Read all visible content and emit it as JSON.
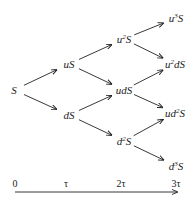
{
  "diagram": {
    "type": "binomial-tree",
    "nodes": [
      {
        "id": "S",
        "base": "",
        "pre": "",
        "sup": "",
        "post": "S",
        "label": "S",
        "x": 14,
        "y": 90
      },
      {
        "id": "uS",
        "pre": "u",
        "sup": "",
        "post": "S",
        "label": "uS",
        "x": 69,
        "y": 64
      },
      {
        "id": "dS",
        "pre": "d",
        "sup": "",
        "post": "S",
        "label": "dS",
        "x": 69,
        "y": 115
      },
      {
        "id": "u2S",
        "pre": "u",
        "sup": "2",
        "post": "S",
        "label": "u²S",
        "x": 124,
        "y": 39
      },
      {
        "id": "udS",
        "pre": "ud",
        "sup": "",
        "post": "S",
        "label": "udS",
        "x": 124,
        "y": 90
      },
      {
        "id": "d2S",
        "pre": "d",
        "sup": "2",
        "post": "S",
        "label": "d²S",
        "x": 124,
        "y": 141
      },
      {
        "id": "u3S",
        "pre": "u",
        "sup": "3",
        "post": "S",
        "label": "u³S",
        "x": 176,
        "y": 18
      },
      {
        "id": "u2dS",
        "pre": "u",
        "sup": "2",
        "post": "dS",
        "label": "u²dS",
        "x": 175,
        "y": 64
      },
      {
        "id": "ud2S",
        "pre": "ud",
        "sup": "2",
        "post": "S",
        "label": "ud²S",
        "x": 175,
        "y": 113
      },
      {
        "id": "d3S",
        "pre": "d",
        "sup": "3",
        "post": "S",
        "label": "d³S",
        "x": 176,
        "y": 166
      }
    ],
    "edges": [
      {
        "from": "S",
        "to": "uS"
      },
      {
        "from": "S",
        "to": "dS"
      },
      {
        "from": "uS",
        "to": "u2S"
      },
      {
        "from": "uS",
        "to": "udS"
      },
      {
        "from": "dS",
        "to": "udS"
      },
      {
        "from": "dS",
        "to": "d2S"
      },
      {
        "from": "u2S",
        "to": "u3S"
      },
      {
        "from": "u2S",
        "to": "u2dS"
      },
      {
        "from": "udS",
        "to": "u2dS"
      },
      {
        "from": "udS",
        "to": "ud2S"
      },
      {
        "from": "d2S",
        "to": "ud2S"
      },
      {
        "from": "d2S",
        "to": "d3S"
      }
    ],
    "time_axis": {
      "ticks": [
        {
          "label": "0",
          "x": 15
        },
        {
          "label": "τ",
          "x": 66
        },
        {
          "label": "2τ",
          "x": 121
        },
        {
          "label": "3τ",
          "x": 176
        }
      ],
      "label_y": 183,
      "line_y": 192,
      "x_start": 15,
      "x_end": 177
    },
    "colors": {
      "ink": "#222222",
      "background": "#ffffff"
    }
  }
}
